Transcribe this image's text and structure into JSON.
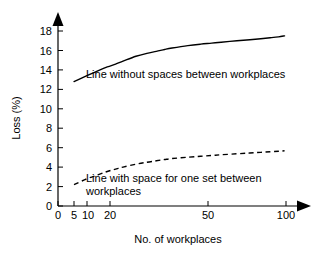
{
  "chart_data": {
    "type": "line",
    "title": "",
    "subtitle": "",
    "xlabel": "No. of workplaces",
    "ylabel": "Loss (%)",
    "xscale": "log",
    "xlim": [
      4,
      110
    ],
    "ylim": [
      0,
      19
    ],
    "x_ticks": [
      0,
      5,
      10,
      20,
      50,
      100
    ],
    "x_tick_labels": [
      "0",
      "5",
      "10",
      "20",
      "50",
      "100"
    ],
    "y_ticks": [
      0,
      2,
      4,
      6,
      8,
      10,
      12,
      14,
      16,
      18
    ],
    "y_tick_labels": [
      "0",
      "2",
      "4",
      "6",
      "8",
      "10",
      "12",
      "14",
      "16",
      "18"
    ],
    "grid": false,
    "legend_position": "inline-annotations",
    "series": [
      {
        "name": "Line without spaces between workplaces",
        "style": "solid",
        "color": "#000000",
        "x": [
          5,
          6,
          7,
          8,
          9,
          10,
          12,
          14,
          16,
          18,
          20,
          25,
          30,
          35,
          40,
          50,
          60,
          70,
          80,
          90,
          98
        ],
        "values": [
          12.8,
          13.4,
          13.9,
          14.3,
          14.6,
          14.9,
          15.4,
          15.7,
          15.9,
          16.1,
          16.25,
          16.5,
          16.65,
          16.75,
          16.85,
          17.0,
          17.1,
          17.2,
          17.3,
          17.4,
          17.5
        ]
      },
      {
        "name": "Line with space for one set between workplaces",
        "style": "dashed",
        "color": "#000000",
        "x": [
          5,
          6,
          7,
          8,
          9,
          10,
          12,
          14,
          16,
          18,
          20,
          25,
          30,
          35,
          40,
          50,
          60,
          70,
          80,
          90,
          98
        ],
        "values": [
          2.2,
          2.8,
          3.2,
          3.55,
          3.8,
          4.0,
          4.3,
          4.5,
          4.65,
          4.78,
          4.88,
          5.02,
          5.12,
          5.2,
          5.27,
          5.37,
          5.45,
          5.52,
          5.58,
          5.63,
          5.68
        ]
      }
    ],
    "annotations": [
      {
        "name": "upper-curve-label",
        "lines": [
          "Line without spaces between workplaces"
        ],
        "x": 86,
        "y": 78
      },
      {
        "name": "lower-curve-label",
        "lines": [
          "Line with space for one set between",
          "workplaces"
        ],
        "x": 86,
        "y": 182
      }
    ],
    "axis_arrows": {
      "x_axis_arrow": "right-arrow-head",
      "y_axis_arrow": "up-arrow-head"
    }
  }
}
